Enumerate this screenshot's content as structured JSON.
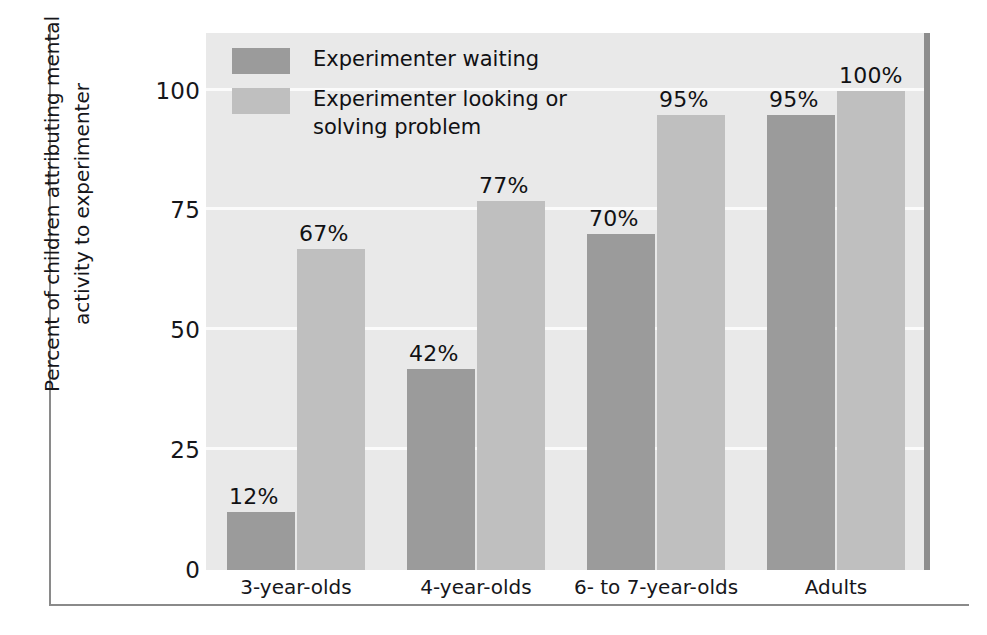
{
  "chart_data": {
    "type": "bar",
    "title": "",
    "xlabel": "",
    "ylabel": "Percent of children attributing mental\nactivity to experimenter",
    "ylim": [
      0,
      112
    ],
    "yticks": [
      "0",
      "25",
      "50",
      "75",
      "100"
    ],
    "ytick_values": [
      0,
      25,
      50,
      75,
      100
    ],
    "grid": "horizontal-white-gridlines",
    "legend_position": "inside-top-left",
    "categories": [
      "3-year-olds",
      "4-year-olds",
      "6- to 7-year-olds",
      "Adults"
    ],
    "series": [
      {
        "name": "Experimenter waiting",
        "color": "#9b9b9b",
        "values": [
          12,
          42,
          70,
          95
        ],
        "labels": [
          "12%",
          "42%",
          "70%",
          "95%"
        ]
      },
      {
        "name": "Experimenter looking or solving problem",
        "color": "#bfbfbf",
        "values": [
          67,
          77,
          95,
          100
        ],
        "labels": [
          "67%",
          "77%",
          "95%",
          "100%"
        ]
      }
    ]
  },
  "legend": {
    "items": [
      {
        "label": "Experimenter waiting",
        "color": "#9b9b9b"
      },
      {
        "label": "Experimenter looking or\nsolving problem",
        "color": "#bfbfbf"
      }
    ]
  },
  "axes": {
    "y_title": "Percent of children attributing mental\nactivity to experimenter",
    "y_tick_labels": [
      "100",
      "75",
      "50",
      "25",
      "0"
    ],
    "x_tick_labels": [
      "3-year-olds",
      "4-year-olds",
      "6- to 7-year-olds",
      "Adults"
    ]
  },
  "colors": {
    "plot_background": "#e9e9e9",
    "gridline": "#fbfbfb",
    "frame_rule": "#8a8a8a",
    "plot_right_rule": "#8d8d8d",
    "series_dark": "#9b9b9b",
    "series_light": "#bfbfbf",
    "text": "#16161a"
  }
}
